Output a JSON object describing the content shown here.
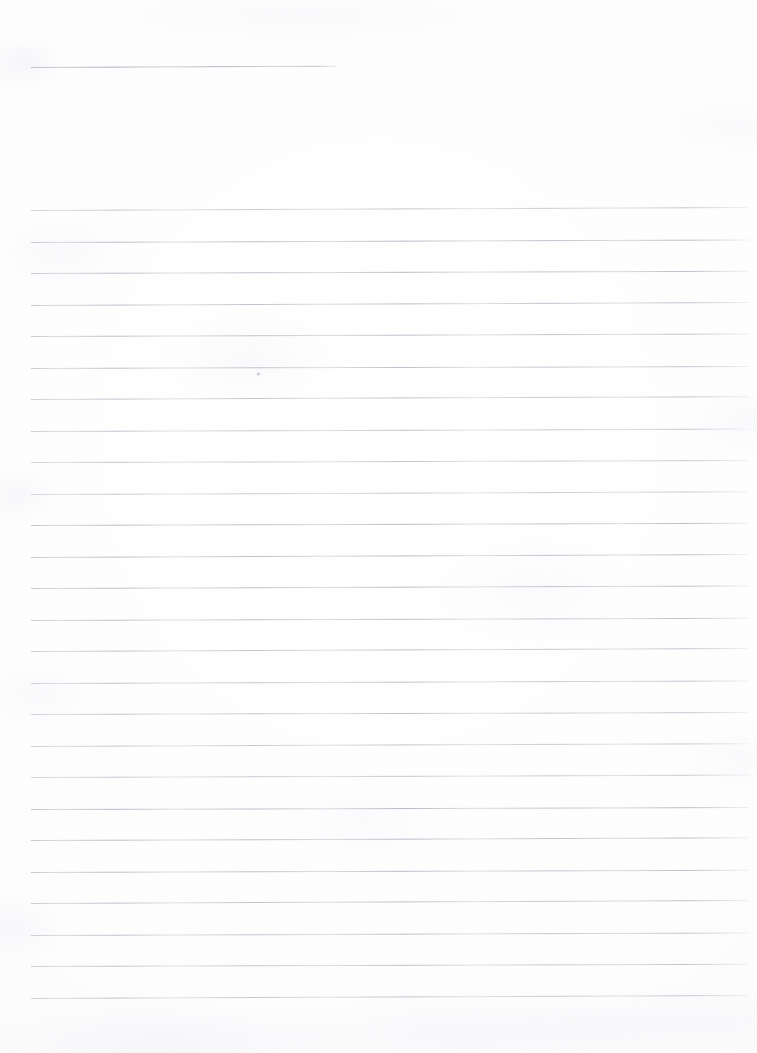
{
  "document": {
    "kind": "scanned-blank-ruled-page",
    "title": "Blank ruled notebook page",
    "width_px": 757,
    "height_px": 1053,
    "has_text": false,
    "text_content": "",
    "visible_text_blocks": [],
    "background_color": "#fefefe",
    "rule_color": "#b0b5c0",
    "rule_thickness_px": 1
  },
  "header_rule": {
    "label": "short top rule",
    "x_start": 31,
    "x_end": 337,
    "y": 67,
    "skew_deg": -0.25,
    "width": 306
  },
  "ruled_area": {
    "label": "body ruled lines",
    "x_start": 31,
    "x_end": 749,
    "width": 718,
    "first_line_y": 210,
    "last_line_y": 997,
    "line_spacing_px": 31.5,
    "line_count": 26,
    "skew_deg": -0.2,
    "lines_y": [
      210.0,
      241.5,
      273.0,
      304.5,
      336.0,
      367.5,
      399.0,
      430.5,
      462.0,
      493.5,
      525.0,
      556.5,
      588.0,
      619.5,
      651.0,
      682.5,
      714.0,
      745.5,
      777.0,
      808.5,
      840.0,
      871.5,
      903.0,
      934.5,
      966.0,
      997.5
    ]
  },
  "artifacts": {
    "stray_mark": {
      "label": "faint pencil dot on rule",
      "x": 256,
      "y": 372
    },
    "top_margin_px": 67,
    "bottom_margin_px": 56,
    "left_margin_px": 31,
    "right_margin_px": 8
  }
}
